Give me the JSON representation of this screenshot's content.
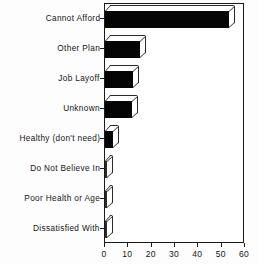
{
  "chart_data": {
    "type": "bar",
    "orientation": "horizontal",
    "title": "",
    "subtitle": "",
    "xlabel": "",
    "ylabel": "",
    "xlim": [
      0,
      60
    ],
    "xticks": [
      0,
      10,
      20,
      30,
      40,
      50,
      60
    ],
    "xtick_labels": [
      "0",
      "10",
      "20",
      "30",
      "40",
      "50",
      "60"
    ],
    "grid": false,
    "legend": false,
    "style": "3d-shadow-bars-monochrome",
    "bar_color": "#050505",
    "frame_color": "#1a1a1a",
    "categories": [
      "Cannot Afford",
      "Other Plan",
      "Job Layoff",
      "Unknown",
      "Healthy (don't need)",
      "Do Not Believe In",
      "Poor Health or Age",
      "Dissatisfied With"
    ],
    "values": [
      53,
      15,
      12,
      11.5,
      3.5,
      0.7,
      0.7,
      0.7
    ]
  }
}
